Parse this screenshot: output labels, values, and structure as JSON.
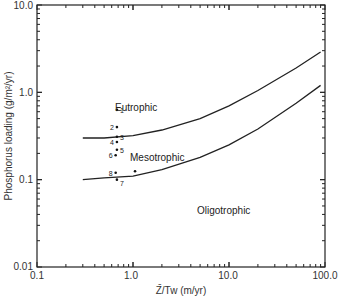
{
  "chart_data": {
    "type": "line",
    "title": "",
    "xlabel": "Z̄/Tw (m/yr)",
    "ylabel": "Phosphorus loading (g/m²/yr)",
    "xscale": "log",
    "yscale": "log",
    "xlim": [
      0.1,
      100.0
    ],
    "ylim": [
      0.01,
      10.0
    ],
    "x_ticks": [
      "0.1",
      "1.0",
      "10.0",
      "100.0"
    ],
    "y_ticks": [
      "0.01",
      "0.1",
      "1.0",
      "10.0"
    ],
    "grid": false,
    "series": [
      {
        "name": "Eutrophic/Mesotrophic boundary",
        "x": [
          0.3,
          0.5,
          1.0,
          2.0,
          5.0,
          10.0,
          20.0,
          50.0,
          90.0
        ],
        "y": [
          0.3,
          0.3,
          0.32,
          0.37,
          0.5,
          0.7,
          1.05,
          1.9,
          2.9
        ]
      },
      {
        "name": "Mesotrophic/Oligotrophic boundary",
        "x": [
          0.3,
          0.5,
          1.0,
          2.0,
          5.0,
          10.0,
          20.0,
          50.0,
          90.0
        ],
        "y": [
          0.1,
          0.105,
          0.11,
          0.13,
          0.18,
          0.25,
          0.38,
          0.75,
          1.2
        ]
      }
    ],
    "points": [
      {
        "label": "1",
        "x": 0.68,
        "y": 0.63
      },
      {
        "label": "2",
        "x": 0.68,
        "y": 0.4
      },
      {
        "label": "3",
        "x": 0.68,
        "y": 0.31
      },
      {
        "label": "4",
        "x": 0.68,
        "y": 0.27
      },
      {
        "label": "5",
        "x": 0.68,
        "y": 0.22
      },
      {
        "label": "6",
        "x": 0.66,
        "y": 0.19
      },
      {
        "label": "8",
        "x": 0.66,
        "y": 0.12
      },
      {
        "label": "7",
        "x": 0.68,
        "y": 0.1
      },
      {
        "label": "",
        "x": 1.05,
        "y": 0.125
      }
    ],
    "annotations": [
      "Eutrophic",
      "Mesotrophic",
      "Oligotrophic"
    ]
  },
  "labels": {
    "xlabel": "Z̄/Tw (m/yr)",
    "ylabel": "Phosphorus loading (g/m²/yr)",
    "eutrophic": "Eutrophic",
    "mesotrophic": "Mesotrophic",
    "oligotrophic": "Oligotrophic",
    "x0": "0.1",
    "x1": "1.0",
    "x2": "10.0",
    "x3": "100.0",
    "y0": "0.01",
    "y1": "0.1",
    "y2": "1.0",
    "y3": "10.0"
  }
}
